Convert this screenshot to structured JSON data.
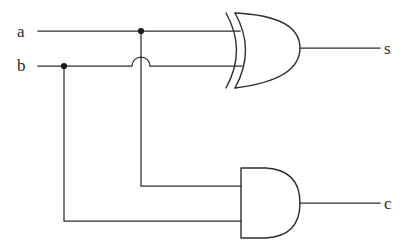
{
  "diagram": {
    "type": "logic-circuit",
    "background_color": "#ffffff",
    "line_color": "#2e2e2e",
    "inputs": [
      {
        "id": "a",
        "label": "a",
        "x": 17,
        "y": 23,
        "wire_y": 31
      },
      {
        "id": "b",
        "label": "b",
        "x": 17,
        "y": 57,
        "wire_y": 66
      }
    ],
    "outputs": [
      {
        "id": "s",
        "label": "s",
        "x": 384,
        "y": 40,
        "wire_y": 48,
        "from_gate": "xor"
      },
      {
        "id": "c",
        "label": "c",
        "x": 384,
        "y": 195,
        "wire_y": 203,
        "from_gate": "and"
      }
    ],
    "gates": [
      {
        "id": "xor",
        "kind": "XOR",
        "name": "xor-gate",
        "x": 226,
        "y": 13,
        "width": 74,
        "height": 75,
        "inputs_y": [
          31,
          66
        ],
        "output_y": 48
      },
      {
        "id": "and",
        "kind": "AND",
        "name": "and-gate",
        "x": 241,
        "y": 168,
        "width": 59,
        "height": 70,
        "inputs_y": [
          186,
          221
        ],
        "output_y": 203
      }
    ],
    "junctions": [
      {
        "id": "tap-a",
        "x": 141,
        "y": 31,
        "on_net": "a",
        "radius": 3.1
      },
      {
        "id": "tap-b",
        "x": 64,
        "y": 66,
        "on_net": "b",
        "radius": 3.1
      }
    ],
    "crossings": [
      {
        "id": "hop-a-over-b",
        "x": 141,
        "y": 66,
        "radius": 9,
        "style": "semicircle-hop"
      }
    ],
    "nets": [
      {
        "id": "a",
        "from": "a",
        "to": [
          "xor.in0",
          "and.in0"
        ]
      },
      {
        "id": "b",
        "from": "b",
        "to": [
          "xor.in1",
          "and.in1"
        ]
      },
      {
        "id": "s",
        "from": "xor.out",
        "to": [
          "s"
        ]
      },
      {
        "id": "c",
        "from": "and.out",
        "to": [
          "c"
        ]
      }
    ],
    "paths": {
      "a_main": "M 38 31 L 240 31",
      "b_main": "M 38 66 L 132 66",
      "b_main_2": "M 150 66 L 242 66",
      "a_branch": "M 141 34 L 141 186 L 241 186",
      "b_branch": "M 64 69 L 64 221 L 241 221",
      "hop": "M 132 66 A 9 9 0 0 1 150 66",
      "s_out": "M 300 48 L 380 48",
      "c_out": "M 300 203 L 380 203",
      "xor_outer_arc": "M 226 13 Q 247 50 226 88",
      "xor_inner_arc": "M 235 13 Q 256 50 235 88",
      "xor_bow": "M 235 13 Q 300 16 300 48 Q 300 80 235 88",
      "and_body": "M 241 168 L 266 168 Q 300 170 300 203 Q 300 236 266 238 L 241 238 Z"
    }
  }
}
